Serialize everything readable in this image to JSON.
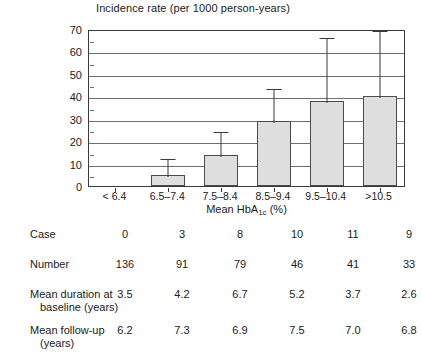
{
  "chart_data": {
    "type": "bar",
    "title": "Incidence rate (per 1000 person-years)",
    "xlabel": "Mean HbA1c (%)",
    "ylabel": "Incidence rate (per 1000 person-years)",
    "categories": [
      "< 6.4",
      "6.5–7.4",
      "7.5–8.4",
      "8.5–9.4",
      "9.5–10.4",
      ">10.5"
    ],
    "values": [
      0,
      5,
      14,
      29,
      38,
      40
    ],
    "error_upper": [
      0,
      13,
      25,
      44,
      67,
      70
    ],
    "ylim": [
      0,
      70
    ],
    "yticks": [
      0,
      10,
      20,
      30,
      40,
      50,
      60,
      70
    ],
    "grid": true,
    "legend": "none",
    "bar_color": "#dedede",
    "bar_edge_color": "#4a4a4a",
    "axis_color": "#3a3a3a",
    "table": {
      "rows": [
        {
          "label": "Case",
          "label_line2": "",
          "values": [
            "0",
            "3",
            "8",
            "10",
            "11",
            "9"
          ]
        },
        {
          "label": "Number",
          "label_line2": "",
          "values": [
            "136",
            "91",
            "79",
            "46",
            "41",
            "33"
          ]
        },
        {
          "label": "Mean duration at",
          "label_line2": "baseline (years)",
          "values": [
            "3.5",
            "4.2",
            "6.7",
            "5.2",
            "3.7",
            "2.6"
          ]
        },
        {
          "label": "Mean follow-up",
          "label_line2": "(years)",
          "values": [
            "6.2",
            "7.3",
            "6.9",
            "7.5",
            "7.0",
            "6.8"
          ]
        }
      ]
    }
  },
  "axis": {
    "title": "Incidence rate (per 1000 person-years)",
    "x_title_pre": "Mean HbA",
    "x_title_sub": "1c",
    "x_title_post": " (%)",
    "ytick_labels": [
      "70",
      "60",
      "50",
      "40",
      "30",
      "20",
      "10",
      "0"
    ]
  }
}
